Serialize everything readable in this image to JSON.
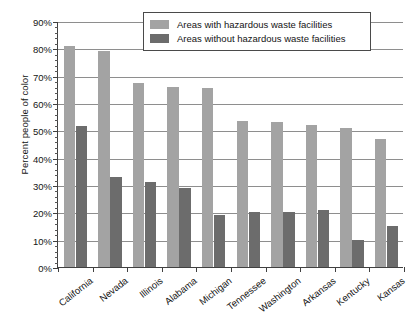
{
  "chart_data": {
    "type": "bar",
    "title": "",
    "subtitle": "",
    "xlabel": "",
    "ylabel": "Percent people of color",
    "ylim": [
      0,
      90
    ],
    "ytick_step": 10,
    "ytick_labels": [
      "0%",
      "10%",
      "20%",
      "30%",
      "40%",
      "50%",
      "60%",
      "70%",
      "80%",
      "90%"
    ],
    "ytick_values": [
      0,
      10,
      20,
      30,
      40,
      50,
      60,
      70,
      80,
      90
    ],
    "grid": "horizontal",
    "legend_position": "top-center",
    "categories": [
      "California",
      "Nevada",
      "Illinois",
      "Alabama",
      "Michigan",
      "Tennessee",
      "Washington",
      "Arkansas",
      "Kentucky",
      "Kansas"
    ],
    "series": [
      {
        "name": "Areas with hazardous waste facilities",
        "color": "#a3a3a3",
        "values": [
          81,
          79,
          67.5,
          66,
          65.5,
          53.5,
          53,
          52,
          51,
          47
        ]
      },
      {
        "name": "Areas without hazardous waste facilities",
        "color": "#6c6c6c",
        "values": [
          51.5,
          33,
          31,
          29,
          19,
          20,
          20,
          21,
          10,
          15
        ]
      }
    ]
  },
  "legend": {
    "items": [
      {
        "label": "Areas with hazardous waste facilities",
        "color": "#a3a3a3"
      },
      {
        "label": "Areas without hazardous waste facilities",
        "color": "#6c6c6c"
      }
    ]
  },
  "axis": {
    "y_title": "Percent people of color"
  }
}
